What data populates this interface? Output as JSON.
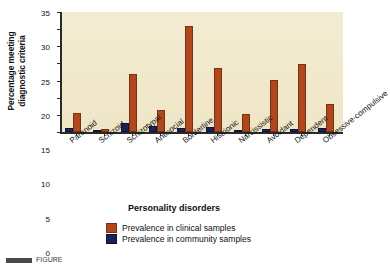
{
  "chart_data": {
    "type": "bar",
    "title": "",
    "xlabel": "Personality disorders",
    "ylabel_line1": "Percentage meeting",
    "ylabel_line2": "diagnostic criteria",
    "ylim": [
      0,
      35
    ],
    "yticks": [
      0,
      5,
      10,
      15,
      20,
      25,
      30,
      35
    ],
    "grid": false,
    "legend_position": "bottom-center",
    "categories": [
      "Paranoid",
      "Schizoid",
      "Schizotypal",
      "Antisocial",
      "Borderline",
      "Histrionic",
      "Narcissistic",
      "Avoidant",
      "Dependent",
      "Obsessive-compulsive"
    ],
    "series": [
      {
        "name": "Prevalence in community samples",
        "color": "#1b2257",
        "values": [
          1.2,
          0.6,
          2.7,
          1.7,
          1.2,
          1.6,
          0.3,
          0.8,
          0.9,
          1.3
        ]
      },
      {
        "name": "Prevalence in clinical samples",
        "color": "#b1481d",
        "values": [
          5.6,
          0.9,
          16.8,
          6.5,
          30.9,
          18.7,
          5.3,
          15.2,
          19.7,
          8.1
        ]
      }
    ]
  },
  "axis": {
    "y_title_line1": "Percentage meeting",
    "y_title_line2": "diagnostic criteria",
    "x_title": "Personality disorders"
  },
  "legend": {
    "items": [
      {
        "label": "Prevalence in clinical samples",
        "color": "#b1481d",
        "swatch": "clinical"
      },
      {
        "label": "Prevalence in community samples",
        "color": "#1b2257",
        "swatch": "community"
      }
    ]
  },
  "caption": {
    "text": "FIGURE"
  },
  "colors": {
    "plot_background": "#f2ead0",
    "axis": "#2a2a2a",
    "clinical": "#b1481d",
    "community": "#1b2257",
    "page_background": "#ffffff"
  }
}
